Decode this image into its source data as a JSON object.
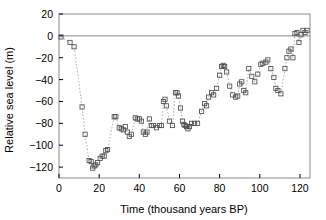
{
  "chart_data": {
    "type": "scatter",
    "title": "",
    "xlabel": "Time (thousand years BP)",
    "ylabel": "Relative sea level (m)",
    "xlim": [
      0,
      125
    ],
    "ylim": [
      -130,
      20
    ],
    "xticks": [
      0,
      20,
      40,
      60,
      80,
      100,
      120
    ],
    "xticklabels": [
      "0",
      "20",
      "40",
      "60",
      "80",
      "100",
      "120"
    ],
    "yticks": [
      20,
      0,
      -20,
      -40,
      -60,
      -80,
      -100,
      -120
    ],
    "yticklabels": [
      "20",
      "0",
      "−20",
      "−40",
      "−60",
      "−80",
      "−100",
      "−120"
    ],
    "grid": false,
    "legend": null,
    "marker_style": "open-square",
    "line_style": "dotted",
    "reference_lines": [
      {
        "axis": "y",
        "value": 0,
        "color": "#8a8a8a"
      }
    ],
    "colors": {
      "marker_edge": "#4d4d4d",
      "connector": "#9a9a9a",
      "frame": "#8a8a8a",
      "text": "#000000"
    },
    "series": [
      {
        "name": "Relative sea level",
        "x": [
          1.0,
          5.5,
          7.5,
          11.5,
          13.0,
          15.0,
          16.0,
          16.8,
          17.5,
          18.3,
          19.2,
          20.5,
          21.5,
          22.5,
          23.3,
          24.2,
          27.5,
          28.3,
          30.0,
          31.0,
          32.0,
          33.0,
          34.0,
          35.0,
          36.0,
          38.0,
          39.0,
          40.0,
          41.0,
          42.0,
          43.0,
          43.8,
          45.0,
          46.0,
          47.0,
          48.5,
          50.0,
          51.0,
          52.0,
          52.8,
          53.5,
          55.0,
          56.5,
          58.0,
          58.8,
          59.5,
          60.5,
          61.5,
          62.2,
          62.8,
          63.5,
          64.2,
          65.0,
          66.0,
          67.5,
          69.0,
          71.0,
          72.5,
          73.5,
          74.5,
          76.0,
          77.0,
          78.5,
          80.0,
          81.0,
          81.8,
          82.5,
          83.5,
          85.0,
          86.5,
          88.0,
          89.0,
          90.0,
          91.0,
          92.0,
          93.0,
          94.5,
          96.0,
          97.5,
          99.0,
          100.5,
          101.5,
          103.0,
          104.0,
          105.5,
          107.0,
          108.0,
          109.0,
          110.5,
          112.5,
          113.5,
          114.5,
          115.5,
          116.5,
          117.5,
          118.5,
          119.5,
          120.5,
          121.5,
          122.5,
          123.5
        ],
        "y": [
          -1.0,
          -6.0,
          -10.0,
          -65.0,
          -90.0,
          -114.0,
          -115.0,
          -121.0,
          -119.0,
          -118.0,
          -116.0,
          -112.0,
          -110.0,
          -110.0,
          -105.0,
          -104.0,
          -74.0,
          -74.0,
          -84.0,
          -85.0,
          -86.0,
          -83.0,
          -88.0,
          -92.0,
          -90.0,
          -75.0,
          -76.0,
          -76.0,
          -78.0,
          -88.0,
          -90.0,
          -88.0,
          -76.0,
          -82.0,
          -82.0,
          -84.0,
          -82.0,
          -82.0,
          -60.0,
          -58.0,
          -64.0,
          -78.0,
          -82.0,
          -52.0,
          -52.0,
          -55.0,
          -66.0,
          -78.0,
          -81.0,
          -82.0,
          -83.0,
          -85.0,
          -83.0,
          -80.0,
          -80.0,
          -80.0,
          -69.0,
          -62.0,
          -64.0,
          -56.0,
          -52.0,
          -54.0,
          -48.0,
          -36.0,
          -28.0,
          -27.0,
          -28.0,
          -33.0,
          -46.0,
          -54.0,
          -56.0,
          -55.0,
          -44.0,
          -42.0,
          -50.0,
          -52.0,
          -30.0,
          -37.0,
          -42.0,
          -35.0,
          -26.0,
          -25.0,
          -24.0,
          -22.0,
          -30.0,
          -38.0,
          -48.0,
          -50.0,
          -53.0,
          -30.0,
          -20.0,
          -14.0,
          -12.0,
          -20.0,
          2.0,
          3.0,
          -6.0,
          1.0,
          5.0,
          3.0,
          5.0
        ]
      }
    ]
  }
}
